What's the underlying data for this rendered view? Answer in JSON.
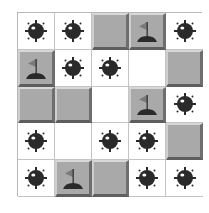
{
  "game": {
    "name": "Minesweeper board",
    "rows": 5,
    "cols": 5,
    "colors": {
      "tile": "#a9a9a9",
      "mine": "#2a2a2a",
      "flag": "#7a7a7a",
      "mound": "#2a2a2a",
      "grid_line": "#c4c4c4"
    },
    "cells": [
      [
        "mine",
        "mine",
        "tile",
        "flag",
        "mine"
      ],
      [
        "flag",
        "mine",
        "mine",
        "empty",
        "tile"
      ],
      [
        "tile",
        "tile",
        "empty",
        "flag",
        "mine"
      ],
      [
        "mine",
        "empty",
        "mine",
        "mine",
        "tile"
      ],
      [
        "mine",
        "flag",
        "tile",
        "mine",
        "mine"
      ]
    ]
  }
}
